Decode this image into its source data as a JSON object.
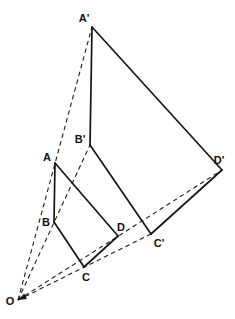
{
  "diagram": {
    "colors": {
      "background": "#ffffff",
      "line": "#161616"
    },
    "points": {
      "O": {
        "label": "O",
        "x": 18,
        "y": 300,
        "lx": 10,
        "ly": 305
      },
      "A": {
        "label": "A",
        "x": 55,
        "y": 163,
        "lx": 47,
        "ly": 161
      },
      "B": {
        "label": "B",
        "x": 54,
        "y": 222,
        "lx": 46,
        "ly": 226
      },
      "C": {
        "label": "C",
        "x": 84,
        "y": 267,
        "lx": 86,
        "ly": 281
      },
      "D": {
        "label": "D",
        "x": 118,
        "y": 236,
        "lx": 121,
        "ly": 231
      },
      "Ap": {
        "label": "A'",
        "x": 92,
        "y": 27,
        "lx": 84,
        "ly": 22
      },
      "Bp": {
        "label": "B'",
        "x": 90,
        "y": 145,
        "lx": 80,
        "ly": 143
      },
      "Cp": {
        "label": "C'",
        "x": 151,
        "y": 234,
        "lx": 159,
        "ly": 247
      },
      "Dp": {
        "label": "D'",
        "x": 222,
        "y": 170,
        "lx": 219,
        "ly": 164
      }
    },
    "solid_edges": [
      [
        "A",
        "B"
      ],
      [
        "B",
        "C"
      ],
      [
        "C",
        "D"
      ],
      [
        "D",
        "A"
      ],
      [
        "Ap",
        "Bp"
      ],
      [
        "Bp",
        "Cp"
      ],
      [
        "Cp",
        "Dp"
      ],
      [
        "Dp",
        "Ap"
      ]
    ],
    "dashed_rays": [
      [
        "O",
        "Ap"
      ],
      [
        "O",
        "Bp"
      ],
      [
        "O",
        "Cp"
      ],
      [
        "O",
        "Dp"
      ]
    ],
    "arrow": {
      "tip": "O",
      "from": "Cp",
      "length": 8.5,
      "half_width": 3
    }
  }
}
